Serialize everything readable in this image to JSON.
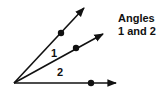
{
  "title": {
    "line1": "Angles",
    "line2": "1 and 2"
  },
  "angle_labels": {
    "angle1": "1",
    "angle2": "2"
  },
  "colors": {
    "stroke": "#111111",
    "background": "#ffffff"
  },
  "geometry": {
    "vertex": [
      14,
      83
    ],
    "rays": [
      {
        "name": "upper-ray",
        "end": [
          84,
          8
        ],
        "point": [
          61,
          33
        ]
      },
      {
        "name": "middle-ray",
        "end": [
          103,
          34
        ],
        "point": [
          76,
          48
        ]
      },
      {
        "name": "bottom-ray",
        "end": [
          116,
          83
        ],
        "point": [
          91,
          83
        ]
      }
    ]
  }
}
